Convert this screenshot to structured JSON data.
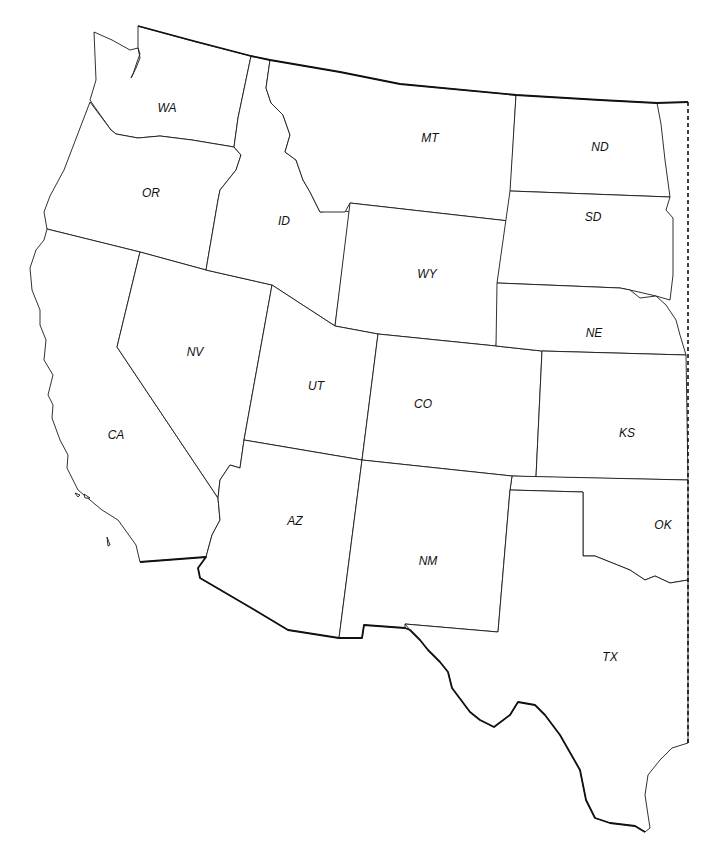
{
  "map": {
    "title": "Western United States",
    "colors": {
      "fill": "#ffffff",
      "border": "#1a1a1a",
      "international_border": "#111111"
    },
    "states": [
      {
        "code": "WA",
        "x": 167,
        "y": 108
      },
      {
        "code": "OR",
        "x": 151,
        "y": 193
      },
      {
        "code": "ID",
        "x": 284,
        "y": 221
      },
      {
        "code": "MT",
        "x": 430,
        "y": 138
      },
      {
        "code": "ND",
        "x": 600,
        "y": 147
      },
      {
        "code": "SD",
        "x": 593,
        "y": 217
      },
      {
        "code": "WY",
        "x": 427,
        "y": 274
      },
      {
        "code": "NE",
        "x": 594,
        "y": 333
      },
      {
        "code": "NV",
        "x": 195,
        "y": 352
      },
      {
        "code": "UT",
        "x": 316,
        "y": 386
      },
      {
        "code": "CO",
        "x": 423,
        "y": 404
      },
      {
        "code": "KS",
        "x": 627,
        "y": 433
      },
      {
        "code": "CA",
        "x": 116,
        "y": 435
      },
      {
        "code": "AZ",
        "x": 295,
        "y": 521
      },
      {
        "code": "OK",
        "x": 663,
        "y": 525
      },
      {
        "code": "NM",
        "x": 428,
        "y": 561
      },
      {
        "code": "TX",
        "x": 610,
        "y": 657
      }
    ]
  }
}
